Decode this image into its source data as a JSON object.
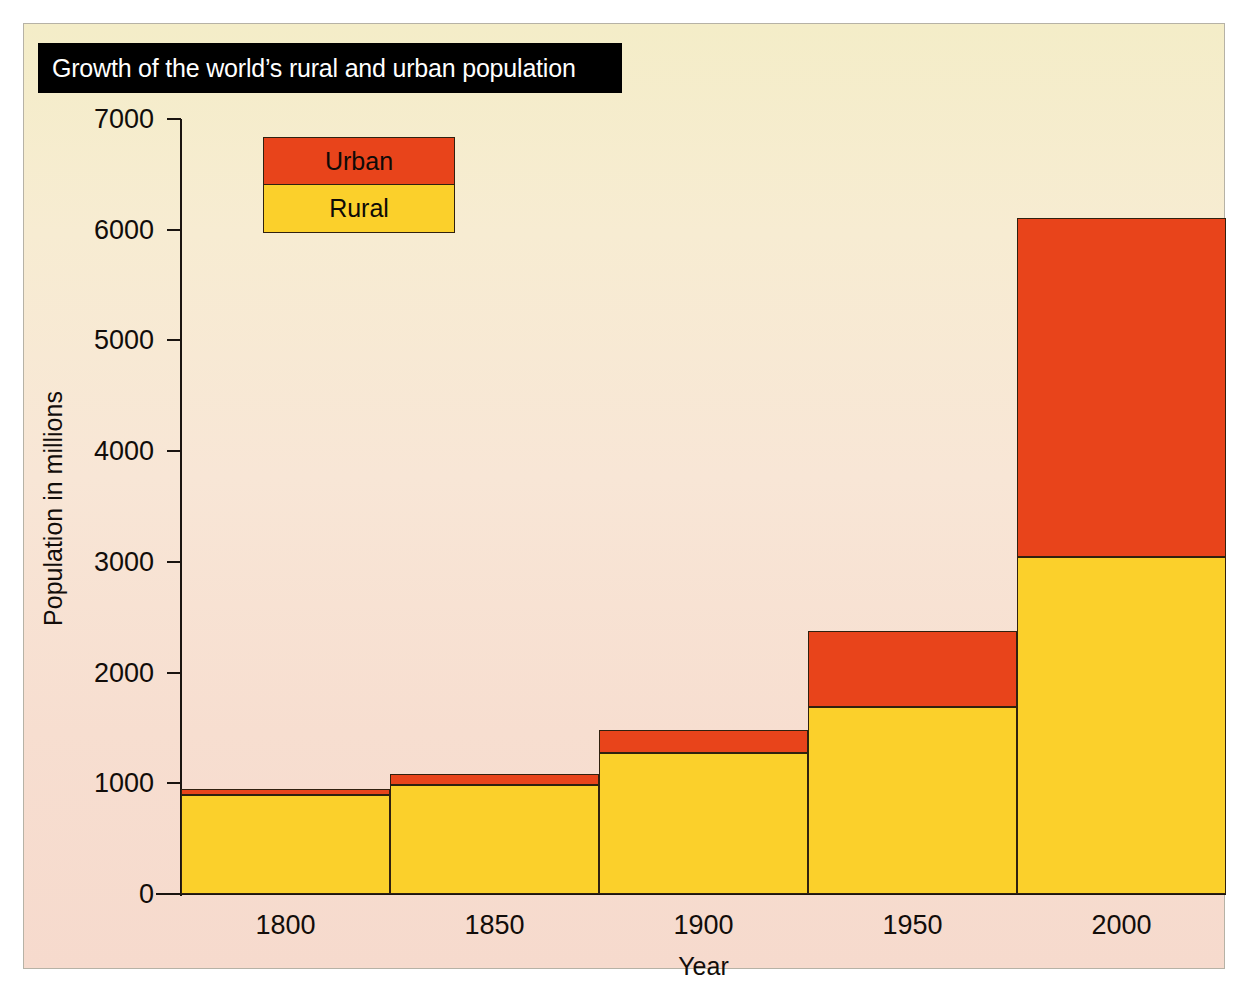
{
  "figure": {
    "title": "Growth of the world’s rural and urban population",
    "background_top_color": "#f4edc8",
    "background_bottom_color": "#f6dacd",
    "title_band_color": "#000000",
    "title_text_color": "#ffffff"
  },
  "legend": {
    "position": "top-left-inside-plot",
    "entries": [
      {
        "label": "Urban",
        "color": "#e8441b"
      },
      {
        "label": "Rural",
        "color": "#fbd02b"
      }
    ]
  },
  "axes": {
    "y_title": "Population in millions",
    "x_title": "Year",
    "y_ticks": [
      "0",
      "1000",
      "2000",
      "3000",
      "4000",
      "5000",
      "6000",
      "7000"
    ],
    "x_ticks": [
      "1800",
      "1850",
      "1900",
      "1950",
      "2000"
    ]
  },
  "chart_data": {
    "type": "bar",
    "stacked": true,
    "title": "Growth of the world’s rural and urban population",
    "xlabel": "Year",
    "ylabel": "Population in millions",
    "categories": [
      "1800",
      "1850",
      "1900",
      "1950",
      "2000"
    ],
    "series": [
      {
        "name": "Rural",
        "color": "#fbd02b",
        "values": [
          895,
          985,
          1270,
          1690,
          3045
        ]
      },
      {
        "name": "Urban",
        "color": "#e8441b",
        "values": [
          55,
          100,
          210,
          690,
          3060
        ]
      }
    ],
    "totals": [
      950,
      1085,
      1480,
      2380,
      6105
    ],
    "ylim": [
      0,
      7000
    ],
    "ytick_step": 1000,
    "grid": false,
    "legend_position": "upper left"
  }
}
